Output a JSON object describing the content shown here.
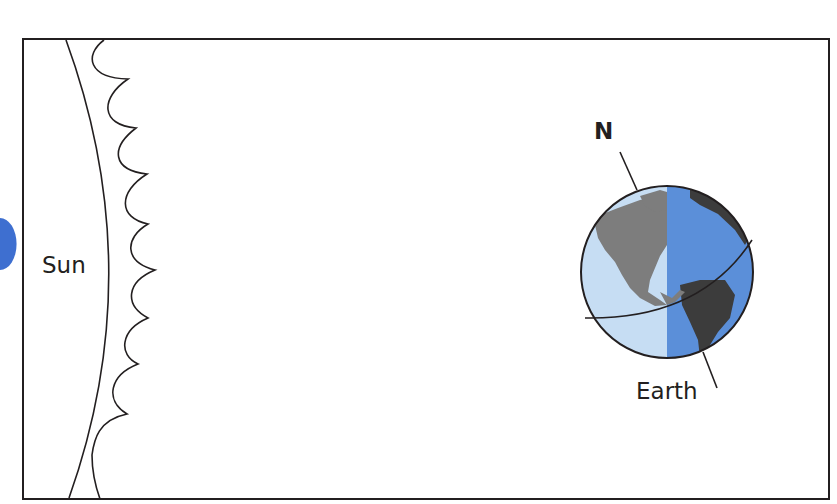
{
  "diagram": {
    "title": "",
    "labels": {
      "sun": "Sun",
      "earth": "Earth",
      "north": "N"
    },
    "elements": [
      {
        "id": "frame",
        "type": "rectangle",
        "description": "Diagram border"
      },
      {
        "id": "sun",
        "type": "arc",
        "description": "Edge of the Sun on the left"
      },
      {
        "id": "sun-corona",
        "type": "wavy-line",
        "description": "Wavy line of solar radiation beside the Sun"
      },
      {
        "id": "earth",
        "type": "globe",
        "description": "Earth with day side (light) facing Sun and night side (dark)"
      },
      {
        "id": "axis-north",
        "type": "pointer-line",
        "description": "Line pointing to the North pole labeled N"
      },
      {
        "id": "equator",
        "type": "ellipse-arc",
        "description": "Tilted equator line across Earth"
      }
    ],
    "colors": {
      "outline": "#231f20",
      "day_side": "#c6ddf3",
      "night_side": "#5b8fd9",
      "land_day": "#7d7d7d",
      "land_night": "#3c3c3c",
      "edge_accent": "#3e6fd0"
    }
  }
}
